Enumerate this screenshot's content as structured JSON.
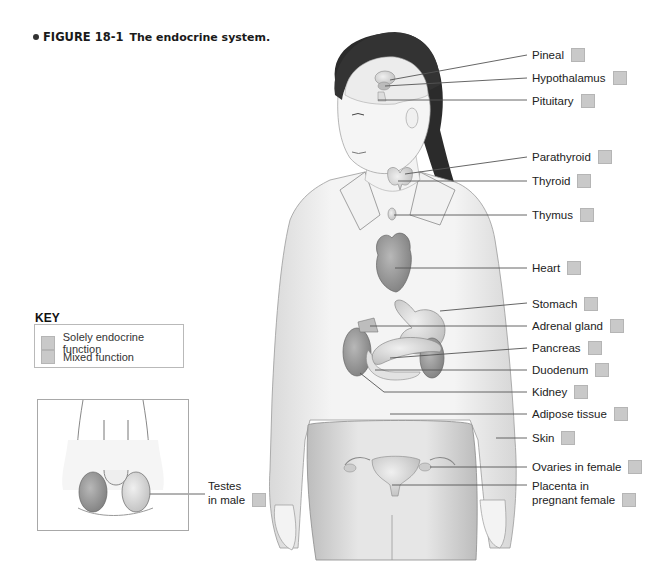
{
  "caption": {
    "figure_number": "FIGURE 18-1",
    "title": "The endocrine system."
  },
  "labels": [
    {
      "id": "pineal",
      "text": "Pineal"
    },
    {
      "id": "hypothalamus",
      "text": "Hypothalamus"
    },
    {
      "id": "pituitary",
      "text": "Pituitary"
    },
    {
      "id": "parathyroid",
      "text": "Parathyroid"
    },
    {
      "id": "thyroid",
      "text": "Thyroid"
    },
    {
      "id": "thymus",
      "text": "Thymus"
    },
    {
      "id": "heart",
      "text": "Heart"
    },
    {
      "id": "stomach",
      "text": "Stomach"
    },
    {
      "id": "adrenal",
      "text": "Adrenal gland"
    },
    {
      "id": "pancreas",
      "text": "Pancreas"
    },
    {
      "id": "duodenum",
      "text": "Duodenum"
    },
    {
      "id": "kidney",
      "text": "Kidney"
    },
    {
      "id": "adipose",
      "text": "Adipose tissue"
    },
    {
      "id": "skin",
      "text": "Skin"
    },
    {
      "id": "ovaries",
      "text": "Ovaries in female"
    },
    {
      "id": "placenta",
      "text": "Placenta in\npregnant female"
    },
    {
      "id": "testes",
      "text": "Testes\nin male"
    }
  ],
  "key": {
    "title": "KEY",
    "items": [
      {
        "label": "Solely endocrine function"
      },
      {
        "label": "Mixed function"
      }
    ]
  },
  "colors": {
    "swatch": "#c9c9c9",
    "swatch_border": "#b5b5b5",
    "leader_line": "#555555"
  }
}
